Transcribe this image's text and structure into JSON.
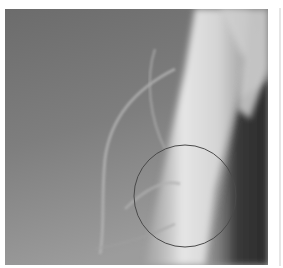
{
  "image": {
    "description": "Grayscale radiograph with circular annotation marker",
    "colors": {
      "background_dark": "#6f6f6f",
      "background_light": "#9a9a9a",
      "bone_bright": "#e8e8e8",
      "shadow_dark": "#2e2e2e",
      "annotation_stroke": "#4a4a4a"
    },
    "annotation": {
      "shape": "circle",
      "cx": 185,
      "cy": 195,
      "r": 50
    }
  }
}
